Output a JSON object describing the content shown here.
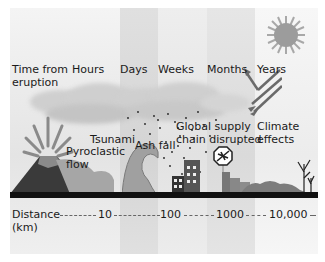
{
  "diagram": {
    "time_axis_label": [
      "Time from",
      "eruption"
    ],
    "time_labels": [
      "Hours",
      "Days",
      "Weeks",
      "Months",
      "Years"
    ],
    "impacts": {
      "pyroclastic": [
        "Pyroclastic",
        "flow"
      ],
      "tsunami": "Tsunami",
      "ash_fall": "Ash fall",
      "supply_chain": [
        "Global supply",
        "chain disrupted"
      ],
      "climate": [
        "Climate",
        "effects"
      ]
    },
    "distance_axis_label": [
      "Distance",
      "(km)"
    ],
    "distance_labels": [
      "10",
      "100",
      "1000",
      "10,000"
    ],
    "icons": [
      "volcano-icon",
      "wave-icon",
      "city-icon",
      "no-flight-sign-icon",
      "factory-icon",
      "dead-tree-icon",
      "sun-icon",
      "radiation-arrows-icon"
    ],
    "colors": {
      "ground": "#111111",
      "volcano": "#3a3a3a",
      "sun": "#9a9a9a"
    }
  }
}
